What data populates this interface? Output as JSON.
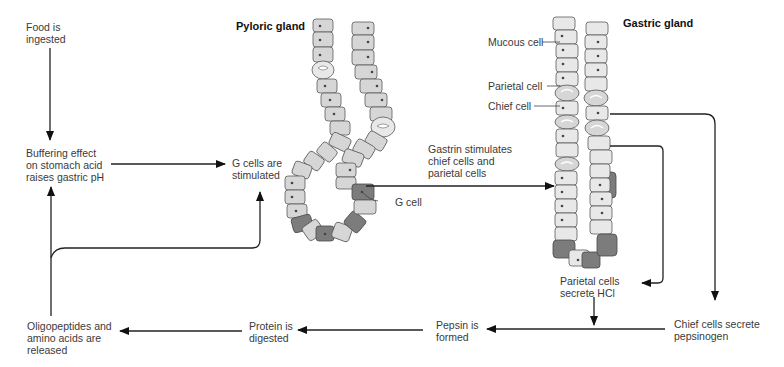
{
  "diagram": {
    "titles": {
      "pyloric_gland": "Pyloric gland",
      "gastric_gland": "Gastric gland"
    },
    "cell_labels": {
      "mucous_cell": "Mucous cell",
      "parietal_cell": "Parietal cell",
      "chief_cell": "Chief cell",
      "g_cell": "G cell"
    },
    "steps": {
      "food_ingested": "Food is\ningested",
      "buffering": "Buffering effect\non stomach acid\nraises gastric pH",
      "g_cells_stimulated": "G cells are\nstimulated",
      "gastrin": "Gastrin stimulates\nchief cells and\nparietal cells",
      "parietal_secrete": "Parietal cells\nsecrete HCl",
      "chief_secrete": "Chief cells secrete\npepsinogen",
      "pepsin_formed": "Pepsin is\nformed",
      "protein_digested": "Protein is\ndigested",
      "oligopeptides": "Oligopeptides and\namino acids are\nreleased"
    },
    "flow": [
      {
        "from": "food_ingested",
        "to": "buffering"
      },
      {
        "from": "buffering",
        "to": "g_cells_stimulated"
      },
      {
        "from": "g_cells_stimulated",
        "to": "gastrin"
      },
      {
        "from": "gastrin",
        "to": "gastric_gland"
      },
      {
        "from": "gastric_gland",
        "to": "parietal_secrete"
      },
      {
        "from": "gastric_gland",
        "to": "chief_secrete"
      },
      {
        "from": "parietal_secrete",
        "to": "pepsin_formed"
      },
      {
        "from": "chief_secrete",
        "to": "pepsin_formed"
      },
      {
        "from": "pepsin_formed",
        "to": "protein_digested"
      },
      {
        "from": "protein_digested",
        "to": "oligopeptides"
      },
      {
        "from": "oligopeptides",
        "to": "buffering"
      },
      {
        "from": "oligopeptides",
        "to": "g_cells_stimulated"
      }
    ]
  }
}
